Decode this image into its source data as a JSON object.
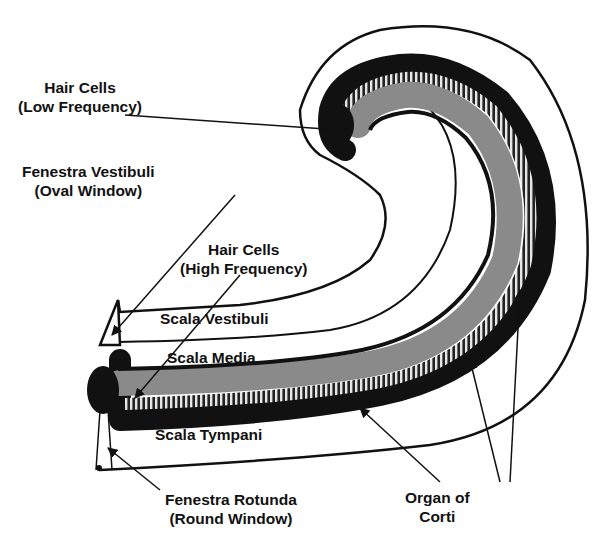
{
  "diagram": {
    "colors": {
      "outline": "#111111",
      "scala_media_fill": "#8a8a8a",
      "hair_cell_stripes": "#e6e6e6",
      "background": "#ffffff"
    },
    "labels": {
      "hair_cells_low": {
        "line1": "Hair Cells",
        "line2": "(Low Frequency)"
      },
      "fenestra_vestibuli": {
        "line1": "Fenestra Vestibuli",
        "line2": "(Oval Window)"
      },
      "hair_cells_high": {
        "line1": "Hair Cells",
        "line2": "(High Frequency)"
      },
      "scala_vestibuli": "Scala Vestibuli",
      "scala_media": "Scala Media",
      "scala_tympani": "Scala Tympani",
      "fenestra_rotunda": {
        "line1": "Fenestra Rotunda",
        "line2": "(Round Window)"
      },
      "organ_of_corti": {
        "line1": "Organ of",
        "line2": "Corti"
      }
    }
  }
}
